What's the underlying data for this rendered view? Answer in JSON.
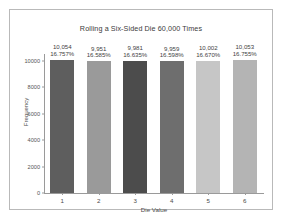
{
  "figure": {
    "background_color": "#ffffff",
    "frame_color": "#b9b9b9",
    "axis_color": "#9a9a9a"
  },
  "chart_data": {
    "type": "bar",
    "title": "Rolling a Six-Sided Die 60,000 Times",
    "xlabel": "Die Value",
    "ylabel": "Frequency",
    "categories": [
      "1",
      "2",
      "3",
      "4",
      "5",
      "6"
    ],
    "values": [
      10054,
      9951,
      9981,
      9959,
      10002,
      10053
    ],
    "value_labels": [
      "10,054",
      "9,951",
      "9,981",
      "9,959",
      "10,002",
      "10,053"
    ],
    "percent_labels": [
      "16.757%",
      "16.585%",
      "16.635%",
      "16.598%",
      "16.670%",
      "16.755%"
    ],
    "percent_values": [
      16.757,
      16.585,
      16.635,
      16.598,
      16.67,
      16.755
    ],
    "bar_colors": [
      "#5e5e5e",
      "#9a9a9a",
      "#4c4c4c",
      "#6e6e6e",
      "#c6c6c6",
      "#b4b4b4"
    ],
    "ylim": [
      0,
      10500
    ],
    "yticks": [
      0,
      2000,
      4000,
      6000,
      8000,
      10000
    ],
    "ytick_labels": [
      "0",
      "2000",
      "4000",
      "6000",
      "8000",
      "10000"
    ],
    "grid": false,
    "legend": false,
    "total_rolls": 60000
  }
}
